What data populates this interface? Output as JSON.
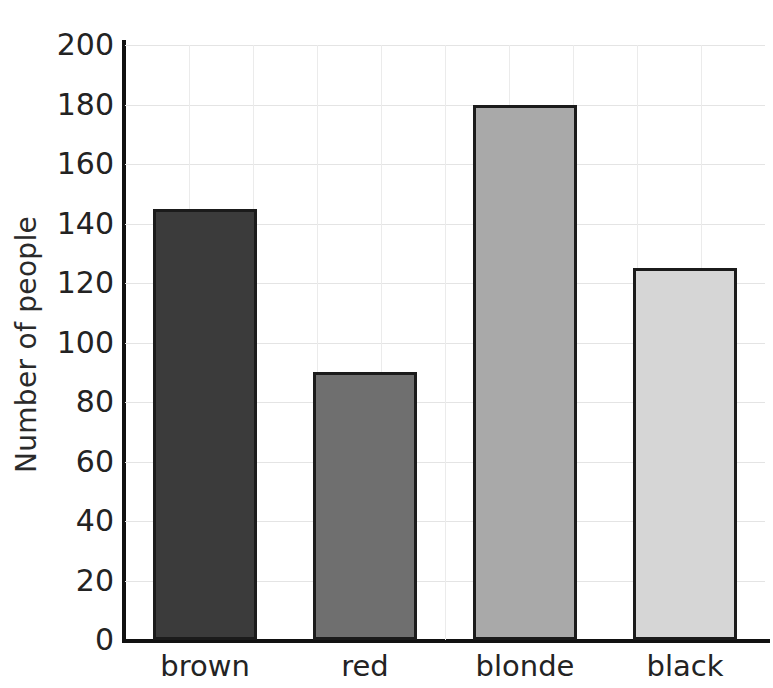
{
  "chart_data": {
    "type": "bar",
    "title": "",
    "title_note": "title is cropped off the top edge of the screenshot",
    "categories": [
      "brown",
      "red",
      "blonde",
      "black"
    ],
    "values": [
      145,
      90,
      180,
      125
    ],
    "xlabel": "",
    "ylabel": "Number of people",
    "ylim": [
      0,
      200
    ],
    "ytick_step": 20,
    "yticks": [
      0,
      20,
      40,
      60,
      80,
      100,
      120,
      140,
      160,
      180,
      200
    ],
    "ytick_labels": [
      "0",
      "20",
      "40",
      "60",
      "80",
      "100",
      "120",
      "140",
      "160",
      "180",
      "200"
    ],
    "grid": true,
    "grid_axes": "both",
    "legend": false,
    "bar_colors": [
      "#3b3b3b",
      "#6f6f6f",
      "#a9a9a9",
      "#d6d6d6"
    ],
    "bar_edge_color": "#1b1b1b",
    "grid_color": "#e4e4e4",
    "axis_color": "#111111",
    "background": "#ffffff"
  },
  "axis": {
    "y_title": "Number of people"
  },
  "vertical_gridline_count": 9
}
